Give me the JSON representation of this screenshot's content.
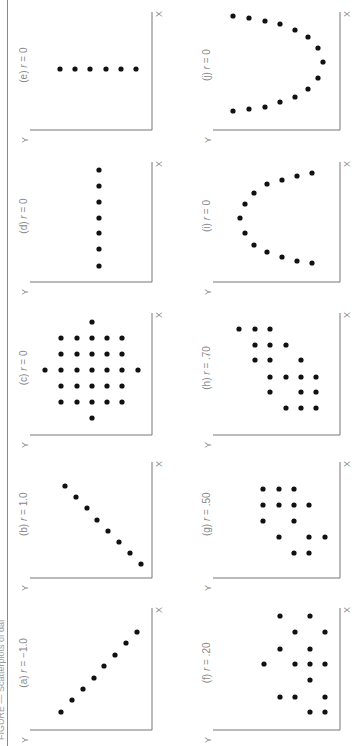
{
  "figure": {
    "orientation": "rotated 90 degrees counter-clockwise",
    "caption_fragment": "FIGURE — Scatterplots of data sets with different correlations",
    "axis_x_label": "X",
    "axis_y_label": "Y",
    "dot_color": "#111111",
    "axis_color": "#777777",
    "label_color": "#8a8a8a"
  },
  "chart_data": [
    {
      "id": "a",
      "type": "scatter",
      "title": "(a) r = −1.0",
      "r": -1.0,
      "xlabel": "X",
      "ylabel": "Y",
      "points": [
        [
          1,
          1
        ],
        [
          2,
          2
        ],
        [
          3,
          3
        ],
        [
          4,
          4
        ],
        [
          5,
          5
        ],
        [
          6,
          6
        ],
        [
          7,
          7
        ],
        [
          8,
          8
        ]
      ]
    },
    {
      "id": "b",
      "type": "scatter",
      "title": "(b) r = 1.0",
      "r": 1.0,
      "xlabel": "X",
      "ylabel": "Y",
      "points": [
        [
          1,
          1
        ],
        [
          2,
          2
        ],
        [
          3,
          3
        ],
        [
          4,
          4
        ],
        [
          5,
          5
        ],
        [
          6,
          6
        ],
        [
          7,
          7
        ],
        [
          8,
          8
        ]
      ]
    },
    {
      "id": "c",
      "type": "scatter",
      "title": "(c) r = 0",
      "r": 0,
      "xlabel": "X",
      "ylabel": "Y",
      "points": [
        [
          4,
          1
        ],
        [
          1,
          4
        ],
        [
          7,
          4
        ],
        [
          4,
          7
        ],
        [
          2,
          2
        ],
        [
          3,
          2
        ],
        [
          4,
          2
        ],
        [
          5,
          2
        ],
        [
          6,
          2
        ],
        [
          2,
          3
        ],
        [
          3,
          3
        ],
        [
          4,
          3
        ],
        [
          5,
          3
        ],
        [
          6,
          3
        ],
        [
          2,
          4
        ],
        [
          3,
          4
        ],
        [
          4,
          4
        ],
        [
          5,
          4
        ],
        [
          6,
          4
        ],
        [
          2,
          5
        ],
        [
          3,
          5
        ],
        [
          4,
          5
        ],
        [
          5,
          5
        ],
        [
          6,
          5
        ],
        [
          2,
          6
        ],
        [
          3,
          6
        ],
        [
          4,
          6
        ],
        [
          5,
          6
        ],
        [
          6,
          6
        ]
      ]
    },
    {
      "id": "d",
      "type": "scatter",
      "title": "(d) r = 0",
      "r": 0,
      "xlabel": "X",
      "ylabel": "Y",
      "points": [
        [
          1,
          4
        ],
        [
          2,
          4
        ],
        [
          3,
          4
        ],
        [
          4,
          4
        ],
        [
          5,
          4
        ],
        [
          6,
          4
        ],
        [
          7,
          4
        ]
      ]
    },
    {
      "id": "e",
      "type": "scatter",
      "title": "(e) r = 0",
      "r": 0,
      "xlabel": "X",
      "ylabel": "Y",
      "points": [
        [
          4,
          1
        ],
        [
          4,
          2
        ],
        [
          4,
          3
        ],
        [
          4,
          4
        ],
        [
          4,
          5
        ],
        [
          4,
          6
        ]
      ]
    },
    {
      "id": "f",
      "type": "scatter",
      "title": "(f) r = .20",
      "r": 0.2,
      "xlabel": "X",
      "ylabel": "Y",
      "points": [
        [
          3,
          1
        ],
        [
          4,
          1
        ],
        [
          5,
          2
        ],
        [
          2,
          3
        ],
        [
          3,
          3
        ],
        [
          5,
          3
        ],
        [
          4,
          4
        ],
        [
          5,
          5
        ],
        [
          3,
          5
        ],
        [
          3,
          6
        ],
        [
          4,
          7
        ],
        [
          2,
          7
        ],
        [
          4,
          8
        ],
        [
          4,
          9
        ],
        [
          2,
          9
        ],
        [
          4,
          10
        ]
      ]
    },
    {
      "id": "g",
      "type": "scatter",
      "title": "(g) r = .50",
      "r": 0.5,
      "xlabel": "X",
      "ylabel": "Y",
      "points": [
        [
          1,
          3
        ],
        [
          2,
          3
        ],
        [
          4,
          2
        ],
        [
          4,
          3
        ],
        [
          5,
          3
        ],
        [
          2,
          5
        ],
        [
          3,
          5
        ],
        [
          5,
          4
        ],
        [
          2,
          6
        ],
        [
          3,
          6
        ],
        [
          4,
          6
        ],
        [
          2,
          7
        ],
        [
          3,
          7
        ],
        [
          4,
          7
        ],
        [
          4,
          8
        ]
      ]
    },
    {
      "id": "h",
      "type": "scatter",
      "title": "(h) r = .70",
      "r": 0.7,
      "xlabel": "X",
      "ylabel": "Y",
      "points": [
        [
          1,
          2
        ],
        [
          1,
          3
        ],
        [
          1,
          4
        ],
        [
          2,
          1
        ],
        [
          2,
          2
        ],
        [
          2,
          4
        ],
        [
          3,
          1
        ],
        [
          3,
          2
        ],
        [
          3,
          3
        ],
        [
          3,
          5
        ],
        [
          4,
          3
        ],
        [
          4,
          4
        ],
        [
          4,
          5
        ],
        [
          5,
          4
        ],
        [
          5,
          5
        ],
        [
          6,
          4
        ],
        [
          6,
          5
        ],
        [
          6,
          6
        ]
      ]
    },
    {
      "id": "i",
      "type": "scatter",
      "title": "(i) r = 0",
      "r": 0,
      "xlabel": "X",
      "ylabel": "Y",
      "points": [
        [
          1,
          1
        ],
        [
          2,
          1.2
        ],
        [
          3,
          1.6
        ],
        [
          4,
          2.3
        ],
        [
          5,
          3.2
        ],
        [
          6,
          4.3
        ],
        [
          7,
          5.6
        ],
        [
          8,
          4.3
        ],
        [
          9,
          3.2
        ],
        [
          10,
          2.3
        ],
        [
          11,
          1.6
        ],
        [
          12,
          1.2
        ],
        [
          13,
          1
        ]
      ]
    },
    {
      "id": "j",
      "type": "scatter",
      "title": "(j) r = 0",
      "r": 0,
      "xlabel": "X",
      "ylabel": "Y",
      "points": [
        [
          1,
          7
        ],
        [
          2,
          6.4
        ],
        [
          3,
          5.4
        ],
        [
          4,
          4.4
        ],
        [
          5,
          3.4
        ],
        [
          6,
          2.4
        ],
        [
          7,
          1.6
        ],
        [
          8,
          1.2
        ],
        [
          9,
          1
        ],
        [
          10,
          1.2
        ],
        [
          11,
          1.6
        ],
        [
          12,
          2.4
        ],
        [
          13,
          3.4
        ],
        [
          14,
          4.4
        ],
        [
          15,
          5.4
        ],
        [
          16,
          6.4
        ],
        [
          17,
          7
        ]
      ]
    }
  ],
  "panels": [
    {
      "id": "e",
      "label_prefix": "(e)",
      "label_r": "r",
      "label_value": "= 0"
    },
    {
      "id": "j",
      "label_prefix": "(j)",
      "label_r": "r",
      "label_value": "= 0"
    },
    {
      "id": "d",
      "label_prefix": "(d)",
      "label_r": "r",
      "label_value": "= 0"
    },
    {
      "id": "i",
      "label_prefix": "(i)",
      "label_r": "r",
      "label_value": "= 0"
    },
    {
      "id": "c",
      "label_prefix": "(c)",
      "label_r": "r",
      "label_value": "= 0"
    },
    {
      "id": "h",
      "label_prefix": "(h)",
      "label_r": "r",
      "label_value": "= .70"
    },
    {
      "id": "b",
      "label_prefix": "(b)",
      "label_r": "r",
      "label_value": "= 1.0"
    },
    {
      "id": "g",
      "label_prefix": "(g)",
      "label_r": "r",
      "label_value": "= .50"
    },
    {
      "id": "a",
      "label_prefix": "(a)",
      "label_r": "r",
      "label_value": "= −1.0"
    },
    {
      "id": "f",
      "label_prefix": "(f)",
      "label_r": "r",
      "label_value": "= .20"
    }
  ]
}
